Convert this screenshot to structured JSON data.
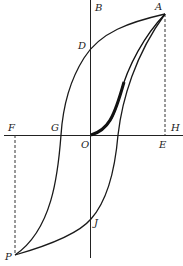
{
  "diagram": {
    "type": "hysteresis-loop",
    "colors": {
      "line": "#1a1a1a",
      "background": "#ffffff"
    },
    "labels": {
      "A": "A",
      "B": "B",
      "D": "D",
      "E": "E",
      "F": "F",
      "G": "G",
      "H": "H",
      "J": "J",
      "O": "O",
      "P": "P"
    }
  }
}
